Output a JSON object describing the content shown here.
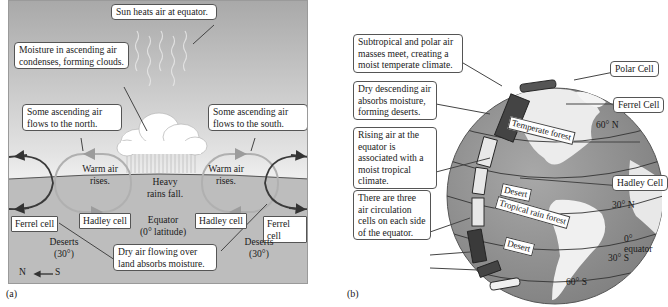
{
  "panel_a": {
    "label": "(a)",
    "callouts": {
      "sun": "Sun heats air at equator.",
      "moisture": "Moisture in ascending air condenses, forming clouds.",
      "north_flow": "Some ascending air flows to the north.",
      "south_flow": "Some ascending air flows to the south.",
      "dry_air": "Dry air flowing over land absorbs moisture."
    },
    "labels": {
      "warm_left": "Warm air rises.",
      "warm_right": "Warm air rises.",
      "rain": "Heavy rains fall.",
      "equator_line1": "Equator",
      "equator_line2": "(0° latitude)",
      "deserts_left_1": "Deserts",
      "deserts_left_2": "(30°)",
      "deserts_right_1": "Deserts",
      "deserts_right_2": "(30°)",
      "compass_n": "N",
      "compass_s": "S"
    },
    "cells": {
      "ferrel_left": "Ferrel cell",
      "hadley_left": "Hadley cell",
      "hadley_right": "Hadley cell",
      "ferrel_right": "Ferrel cell"
    }
  },
  "panel_b": {
    "label": "(b)",
    "callouts": {
      "temperate": "Subtropical and polar air masses meet, creating a moist temperate climate.",
      "deserts": "Dry descending air absorbs moisture, forming deserts.",
      "tropical": "Rising air at the equator is associated with a moist tropical climate.",
      "three_cells": "There are three air circulation cells on each side of the equator."
    },
    "cells": {
      "polar": "Polar Cell",
      "ferrel": "Ferrel Cell",
      "hadley": "Hadley Cell"
    },
    "latitudes": {
      "n60": "60° N",
      "n30": "30° N",
      "equator": "0° equator",
      "s30": "30° S",
      "s60": "60° S"
    },
    "biomes": {
      "temperate_forest": "Temperate forest",
      "desert_north": "Desert",
      "tropical_rain_forest": "Tropical rain forest",
      "desert_south": "Desert"
    }
  },
  "colors": {
    "sky_top": "#a9a9a9",
    "ground": "#bdbdbd",
    "hadley_loop": "#b0b0b0",
    "ferrel_loop": "#3a3a3a",
    "ocean": "#8f8f8f",
    "land": "#f2f2f2"
  }
}
